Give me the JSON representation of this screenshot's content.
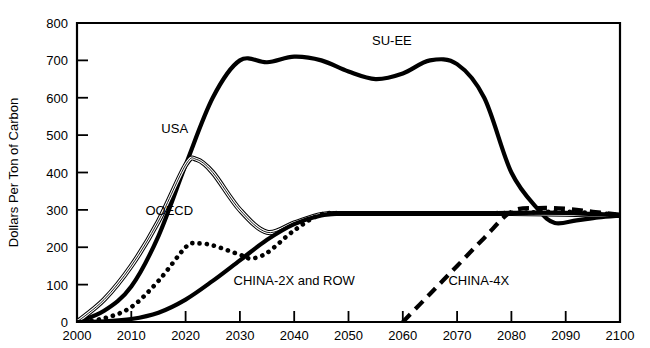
{
  "chart_data": {
    "type": "line",
    "title": "",
    "xlabel": "",
    "ylabel": "Dollars Per Ton of Carbon",
    "xlim": [
      2000,
      2100
    ],
    "ylim": [
      0,
      800
    ],
    "grid": false,
    "legend_position": "inline-annotations",
    "xticks": [
      "2000",
      "2010",
      "2020",
      "2030",
      "2040",
      "2050",
      "2060",
      "2070",
      "2080",
      "2090",
      "2100"
    ],
    "yticks": [
      "0",
      "100",
      "200",
      "300",
      "400",
      "500",
      "600",
      "700",
      "800"
    ],
    "series": [
      {
        "name": "SU-EE",
        "style": "thick-solid",
        "x": [
          2000,
          2005,
          2010,
          2015,
          2020,
          2025,
          2030,
          2035,
          2040,
          2045,
          2050,
          2055,
          2060,
          2065,
          2070,
          2075,
          2080,
          2085,
          2088,
          2092,
          2096,
          2100
        ],
        "values": [
          0,
          30,
          95,
          230,
          420,
          600,
          700,
          695,
          710,
          700,
          670,
          650,
          665,
          700,
          690,
          600,
          400,
          300,
          265,
          272,
          280,
          285
        ]
      },
      {
        "name": "USA",
        "style": "double-thin-solid",
        "x": [
          2000,
          2005,
          2010,
          2015,
          2020,
          2022,
          2025,
          2030,
          2035,
          2040,
          2045,
          2050,
          2060,
          2070,
          2080,
          2090,
          2100
        ],
        "values": [
          0,
          60,
          150,
          270,
          420,
          435,
          400,
          300,
          240,
          265,
          288,
          290,
          290,
          290,
          290,
          288,
          285
        ]
      },
      {
        "name": "OOECD",
        "style": "dotted",
        "x": [
          2000,
          2005,
          2010,
          2015,
          2020,
          2022,
          2025,
          2030,
          2032,
          2035,
          2040,
          2045,
          2050,
          2060,
          2070,
          2080,
          2090,
          2100
        ],
        "values": [
          0,
          10,
          40,
          110,
          200,
          210,
          205,
          180,
          170,
          185,
          245,
          288,
          290,
          290,
          290,
          292,
          295,
          287
        ]
      },
      {
        "name": "CHINA-2X and ROW",
        "style": "thick-solid",
        "x": [
          2000,
          2005,
          2010,
          2015,
          2020,
          2025,
          2030,
          2035,
          2040,
          2045,
          2050,
          2060,
          2070,
          2080,
          2090,
          2100
        ],
        "values": [
          0,
          2,
          8,
          25,
          60,
          110,
          165,
          220,
          262,
          285,
          290,
          290,
          290,
          292,
          292,
          285
        ]
      },
      {
        "name": "CHINA-4X",
        "style": "dashed",
        "x": [
          2060,
          2065,
          2070,
          2075,
          2080,
          2085,
          2090,
          2095,
          2100
        ],
        "values": [
          0,
          75,
          150,
          225,
          295,
          305,
          303,
          295,
          287
        ]
      }
    ],
    "annotations": [
      {
        "text": "SU-EE",
        "x": 2058,
        "y": 742
      },
      {
        "text": "USA",
        "x": 2018,
        "y": 505
      },
      {
        "text": "OOECD",
        "x": 2017,
        "y": 285
      },
      {
        "text": "CHINA-2X and ROW",
        "x": 2040,
        "y": 100
      },
      {
        "text": "CHINA-4X",
        "x": 2074,
        "y": 100
      }
    ]
  }
}
